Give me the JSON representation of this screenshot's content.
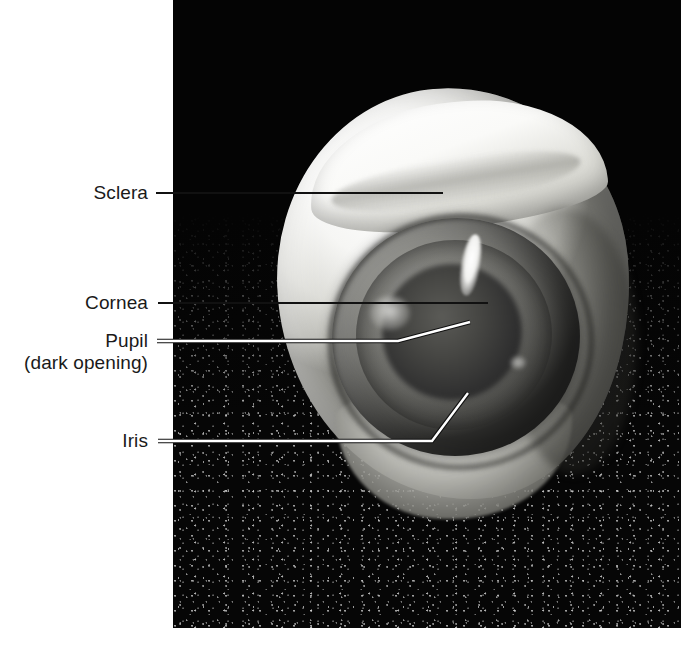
{
  "figure": {
    "kind": "anatomical-photograph",
    "background_color": "#050505",
    "page_color": "#ffffff"
  },
  "labels": [
    {
      "id": "sclera",
      "text": "Sclera",
      "leader": {
        "type": "straight",
        "from": [
          156,
          193
        ],
        "to": [
          443,
          193
        ],
        "color": "#111111"
      }
    },
    {
      "id": "cornea",
      "text": "Cornea",
      "leader": {
        "type": "straight",
        "from": [
          158,
          303
        ],
        "to": [
          488,
          303
        ],
        "color": "#111111"
      }
    },
    {
      "id": "pupil",
      "text": "Pupil",
      "subtext": "(dark opening)",
      "leader": {
        "type": "bent",
        "from": [
          157,
          341
        ],
        "bend": [
          398,
          341
        ],
        "to": [
          470,
          322
        ],
        "color": "#ffffff"
      }
    },
    {
      "id": "iris",
      "text": "Iris",
      "leader": {
        "type": "bent",
        "from": [
          158,
          441
        ],
        "bend": [
          432,
          441
        ],
        "to": [
          468,
          393
        ],
        "color": "#ffffff"
      }
    }
  ],
  "photo": {
    "bounds": {
      "left": 173,
      "top": 0,
      "width": 508,
      "height": 628
    },
    "specimen": {
      "name": "cow-eye-anterior",
      "parts": [
        "sclera",
        "cornea",
        "iris",
        "pupil"
      ]
    }
  }
}
